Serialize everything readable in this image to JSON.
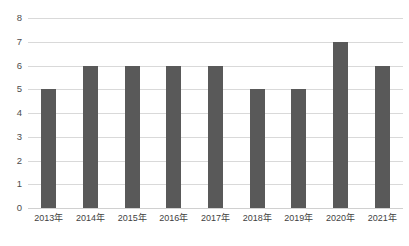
{
  "chart_data": {
    "type": "bar",
    "title": "",
    "subtitle": "",
    "xlabel": "",
    "ylabel": "",
    "categories": [
      "2013年",
      "2014年",
      "2015年",
      "2016年",
      "2017年",
      "2018年",
      "2019年",
      "2020年",
      "2021年"
    ],
    "values": [
      5,
      6,
      6,
      6,
      6,
      5,
      5,
      7,
      6
    ],
    "ylim": [
      0,
      8
    ],
    "ytick_step": 1,
    "yticks": [
      "8",
      "7",
      "6",
      "5",
      "4",
      "3",
      "2",
      "1",
      "0"
    ],
    "ytick_values": [
      8,
      7,
      6,
      5,
      4,
      3,
      2,
      1,
      0
    ],
    "grid": true,
    "grid_axis": "y",
    "legend": false,
    "legend_position": "none",
    "data_labels": false,
    "colors": {
      "bar": "#595959",
      "gridline": "#d9d9d9",
      "baseline": "#d0d0d0",
      "tick_label": "#4d4d4d",
      "category_label": "#3f3f3f",
      "background": "#ffffff"
    }
  }
}
